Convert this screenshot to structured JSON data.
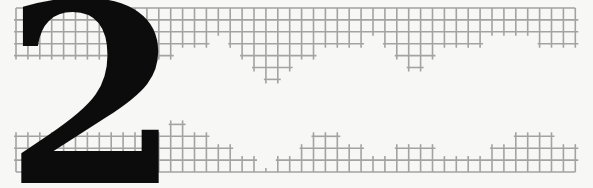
{
  "graphic": {
    "numeral": "2",
    "numeral_color": "#0c0c0c",
    "grid_color": "#a3a3a3",
    "background": "#f7f7f5",
    "grid": {
      "x0": 16,
      "step": 11.9,
      "columns": 48,
      "top_y0": 8,
      "top_depths": [
        4,
        4,
        4,
        4,
        4,
        4,
        4,
        4,
        4,
        4,
        4,
        4,
        4,
        4,
        3,
        3,
        3,
        2,
        3,
        4,
        5,
        6,
        6,
        5,
        4,
        4,
        3,
        3,
        3,
        3,
        2,
        3,
        4,
        5,
        5,
        4,
        3,
        3,
        3,
        3,
        2,
        2,
        2,
        2,
        3,
        3,
        3,
        3
      ],
      "bottom_y": 172,
      "bottom_heights": [
        3,
        3,
        3,
        3,
        3,
        3,
        3,
        3,
        3,
        3,
        3,
        3,
        3,
        4,
        4,
        3,
        3,
        2,
        2,
        1,
        1,
        0,
        1,
        1,
        2,
        3,
        3,
        3,
        2,
        2,
        1,
        1,
        2,
        2,
        2,
        2,
        1,
        1,
        1,
        1,
        2,
        2,
        3,
        3,
        3,
        3,
        2,
        2
      ]
    }
  }
}
